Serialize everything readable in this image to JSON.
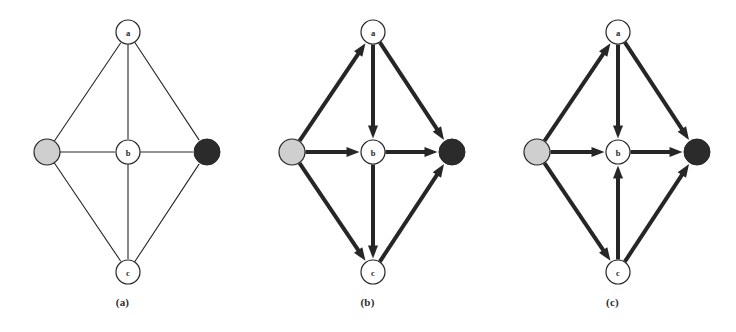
{
  "figure": {
    "background_color": "#ffffff",
    "ink_color": "#262626",
    "panel_count": 3
  },
  "style": {
    "node_white_fill": "#ffffff",
    "node_gray_fill": "#cfcfcf",
    "node_black_fill": "#2b2b2b",
    "node_stroke": "#262626",
    "edge_thin_width": 1.1,
    "edge_thick_width": 4.0,
    "node_radius_labeled": 12,
    "node_radius_gray": 13,
    "node_radius_black": 13
  },
  "nodes": [
    {
      "id": "source",
      "label": "",
      "kind": "gray",
      "x": 47,
      "y": 152
    },
    {
      "id": "a",
      "label": "a",
      "kind": "white",
      "x": 128,
      "y": 32
    },
    {
      "id": "b",
      "label": "b",
      "kind": "white",
      "x": 128,
      "y": 152
    },
    {
      "id": "c",
      "label": "c",
      "kind": "white",
      "x": 128,
      "y": 272
    },
    {
      "id": "sink",
      "label": "",
      "kind": "black",
      "x": 207,
      "y": 152
    }
  ],
  "panels": [
    {
      "id": "a",
      "caption": "(a)",
      "directed": false,
      "edge_style": "thin",
      "edges": [
        {
          "from": "source",
          "to": "a",
          "arrow": false
        },
        {
          "from": "source",
          "to": "b",
          "arrow": false
        },
        {
          "from": "source",
          "to": "c",
          "arrow": false
        },
        {
          "from": "a",
          "to": "sink",
          "arrow": false
        },
        {
          "from": "a",
          "to": "b",
          "arrow": false
        },
        {
          "from": "b",
          "to": "sink",
          "arrow": false
        },
        {
          "from": "b",
          "to": "c",
          "arrow": false
        },
        {
          "from": "c",
          "to": "sink",
          "arrow": false
        }
      ]
    },
    {
      "id": "b",
      "caption": "(b)",
      "directed": true,
      "edge_style": "thick",
      "edges": [
        {
          "from": "source",
          "to": "a",
          "arrow": true
        },
        {
          "from": "source",
          "to": "b",
          "arrow": true
        },
        {
          "from": "source",
          "to": "c",
          "arrow": true
        },
        {
          "from": "a",
          "to": "sink",
          "arrow": true
        },
        {
          "from": "a",
          "to": "b",
          "arrow": true
        },
        {
          "from": "b",
          "to": "sink",
          "arrow": true
        },
        {
          "from": "b",
          "to": "c",
          "arrow": true
        },
        {
          "from": "c",
          "to": "sink",
          "arrow": true
        }
      ]
    },
    {
      "id": "c",
      "caption": "(c)",
      "directed": true,
      "edge_style": "thick",
      "edges": [
        {
          "from": "source",
          "to": "a",
          "arrow": true
        },
        {
          "from": "source",
          "to": "b",
          "arrow": true
        },
        {
          "from": "source",
          "to": "c",
          "arrow": true
        },
        {
          "from": "a",
          "to": "sink",
          "arrow": true
        },
        {
          "from": "a",
          "to": "b",
          "arrow": true
        },
        {
          "from": "b",
          "to": "sink",
          "arrow": true
        },
        {
          "from": "c",
          "to": "b",
          "arrow": true
        },
        {
          "from": "c",
          "to": "sink",
          "arrow": true
        }
      ]
    }
  ]
}
